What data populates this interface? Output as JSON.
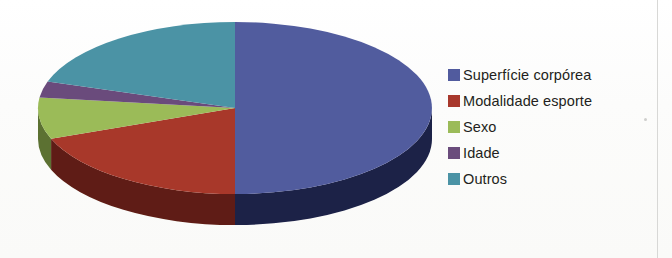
{
  "chart_data": {
    "type": "pie",
    "title": "",
    "subtitle": "",
    "xlabel": "",
    "ylabel": "",
    "three_d": true,
    "grid": false,
    "legend_position": "right",
    "start_angle_deg": 0,
    "direction": "clockwise",
    "categories": [
      "Superfície corpórea",
      "Modalidade esporte",
      "Sexo",
      "Idade",
      "Outros"
    ],
    "values": [
      50,
      19,
      8,
      3,
      20
    ],
    "units": "percent",
    "colors": [
      "#515B9E",
      "#A8382C",
      "#9BBB59",
      "#6A4C7C",
      "#4B93A5"
    ],
    "side_colors": [
      "#1b2047",
      "#5f1d13",
      "#5c7133",
      "#3d2b48",
      "#2b5c69"
    ],
    "slices": [
      {
        "label": "Superfície corpórea",
        "value": 50,
        "color": "#515B9E",
        "side_color": "#1b2047",
        "start_deg": 0,
        "end_deg": 180
      },
      {
        "label": "Modalidade esporte",
        "value": 19,
        "color": "#A8382C",
        "side_color": "#5f1d13",
        "start_deg": 180,
        "end_deg": 249
      },
      {
        "label": "Sexo",
        "value": 8,
        "color": "#9BBB59",
        "side_color": "#5c7133",
        "start_deg": 249,
        "end_deg": 277
      },
      {
        "label": "Idade",
        "value": 3,
        "color": "#6A4C7C",
        "side_color": "#3d2b48",
        "start_deg": 277,
        "end_deg": 288
      },
      {
        "label": "Outros",
        "value": 20,
        "color": "#4B93A5",
        "side_color": "#2b5c69",
        "start_deg": 288,
        "end_deg": 360
      }
    ]
  },
  "legend": {
    "items": [
      {
        "label": "Superfície corpórea",
        "color": "#515B9E"
      },
      {
        "label": "Modalidade esporte",
        "color": "#A8382C"
      },
      {
        "label": "Sexo",
        "color": "#9BBB59"
      },
      {
        "label": "Idade",
        "color": "#6A4C7C"
      },
      {
        "label": "Outros",
        "color": "#4B93A5"
      }
    ]
  },
  "geometry": {
    "cx": 235,
    "cy": 108,
    "rx": 197,
    "ry": 86,
    "depth": 31
  }
}
